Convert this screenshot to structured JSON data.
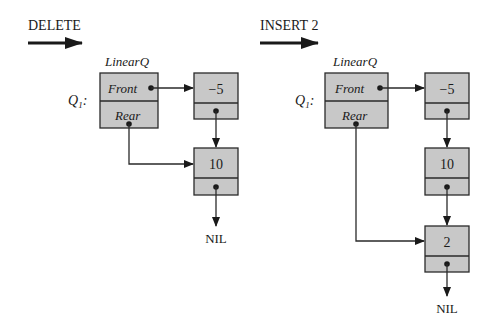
{
  "left_panel": {
    "operation": "DELETE",
    "record_type": "LinearQ",
    "variable": "Q",
    "variable_subscript": "1",
    "fields": {
      "front": "Front",
      "rear": "Rear"
    },
    "nodes": [
      {
        "value": "−5"
      },
      {
        "value": "10"
      }
    ],
    "terminator": "NIL"
  },
  "right_panel": {
    "operation": "INSERT 2",
    "record_type": "LinearQ",
    "variable": "Q",
    "variable_subscript": "1",
    "fields": {
      "front": "Front",
      "rear": "Rear"
    },
    "nodes": [
      {
        "value": "−5"
      },
      {
        "value": "10"
      },
      {
        "value": "2"
      }
    ],
    "terminator": "NIL"
  }
}
